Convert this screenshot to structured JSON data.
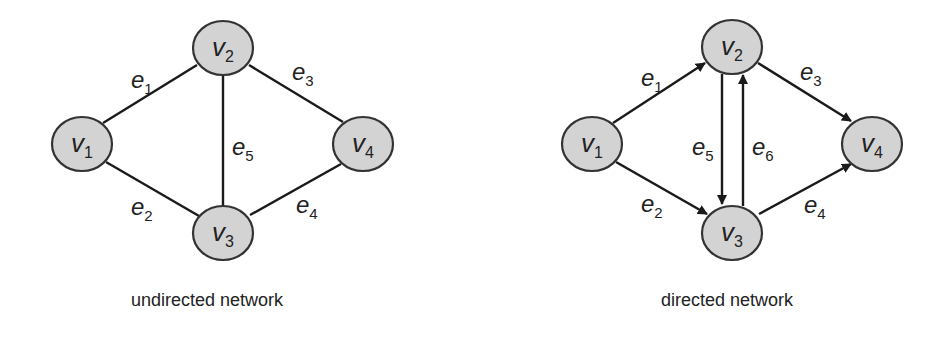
{
  "diagrams": [
    {
      "id": "undirected",
      "caption": "undirected network",
      "nodes": [
        {
          "name": "v",
          "sub": "1",
          "x": 82,
          "y": 144
        },
        {
          "name": "v",
          "sub": "2",
          "x": 223,
          "y": 48
        },
        {
          "name": "v",
          "sub": "3",
          "x": 223,
          "y": 233
        },
        {
          "name": "v",
          "sub": "4",
          "x": 363,
          "y": 144
        }
      ],
      "edges": [
        {
          "name": "e",
          "sub": "1",
          "from": "v1",
          "to": "v2"
        },
        {
          "name": "e",
          "sub": "2",
          "from": "v1",
          "to": "v3"
        },
        {
          "name": "e",
          "sub": "3",
          "from": "v2",
          "to": "v4"
        },
        {
          "name": "e",
          "sub": "4",
          "from": "v3",
          "to": "v4"
        },
        {
          "name": "e",
          "sub": "5",
          "from": "v2",
          "to": "v3"
        }
      ]
    },
    {
      "id": "directed",
      "caption": "directed network",
      "nodes": [
        {
          "name": "v",
          "sub": "1",
          "x": 592,
          "y": 144
        },
        {
          "name": "v",
          "sub": "2",
          "x": 732,
          "y": 47
        },
        {
          "name": "v",
          "sub": "3",
          "x": 732,
          "y": 233
        },
        {
          "name": "v",
          "sub": "4",
          "x": 872,
          "y": 144
        }
      ],
      "edges": [
        {
          "name": "e",
          "sub": "1",
          "from": "v1",
          "to": "v2"
        },
        {
          "name": "e",
          "sub": "2",
          "from": "v1",
          "to": "v3"
        },
        {
          "name": "e",
          "sub": "3",
          "from": "v2",
          "to": "v4"
        },
        {
          "name": "e",
          "sub": "4",
          "from": "v3",
          "to": "v4"
        },
        {
          "name": "e",
          "sub": "5",
          "from": "v2",
          "to": "v3"
        },
        {
          "name": "e",
          "sub": "6",
          "from": "v3",
          "to": "v2"
        }
      ]
    }
  ],
  "colors": {
    "node_fill": "#d3d3d3",
    "node_stroke": "#333333",
    "edge": "#1a1a1a"
  }
}
